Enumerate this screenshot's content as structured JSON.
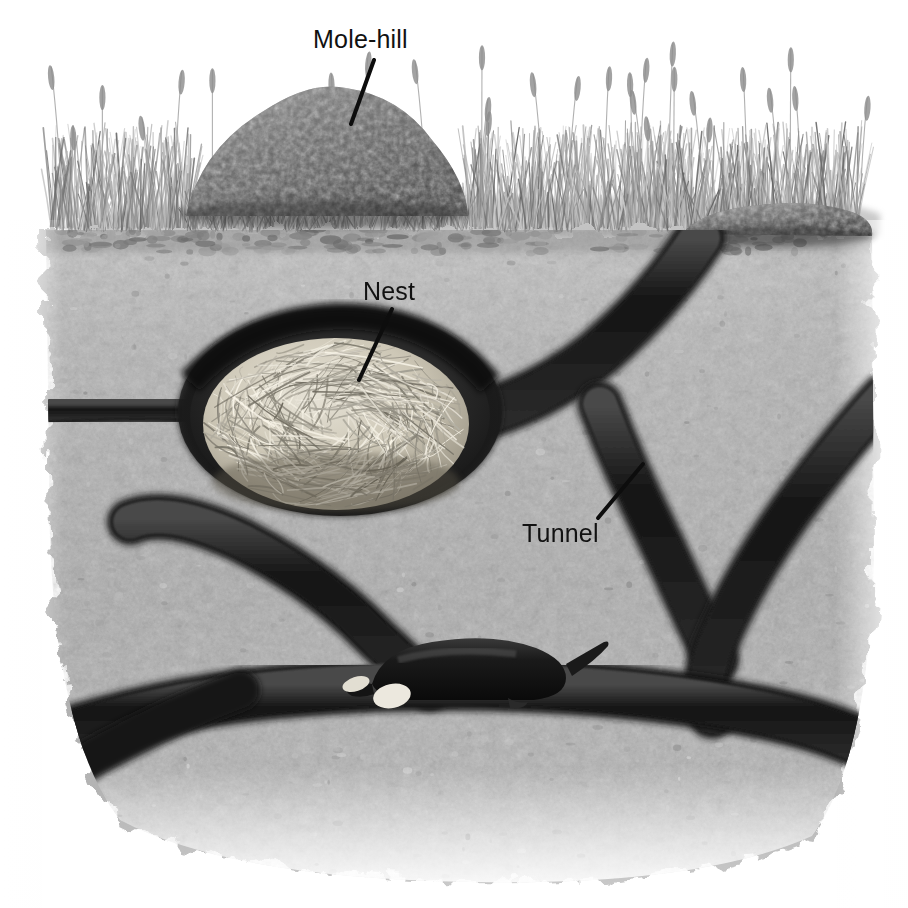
{
  "figure": {
    "kind": "natural-history-illustration",
    "medium": "monochrome stipple and wash drawing",
    "canvas": {
      "width": 908,
      "height": 908,
      "background": "#ffffff"
    }
  },
  "labels": [
    {
      "id": "mole-hill",
      "text": "Mole-hill",
      "x": 313,
      "y": 27,
      "leader": {
        "x1": 374,
        "y1": 60,
        "x2": 351,
        "y2": 124
      }
    },
    {
      "id": "nest",
      "text": "Nest",
      "x": 363,
      "y": 279,
      "leader": {
        "x1": 392,
        "y1": 309,
        "x2": 359,
        "y2": 380
      }
    },
    {
      "id": "tunnel",
      "text": "Tunnel",
      "x": 522,
      "y": 521,
      "leader": {
        "x1": 598,
        "y1": 518,
        "x2": 643,
        "y2": 464
      }
    }
  ],
  "palette": {
    "paper": "#ffffff",
    "soil_light": "#bdbdbd",
    "soil_mid": "#ababab",
    "soil_dark": "#8e8e8e",
    "soil_speckle": "#7d7d7d",
    "tunnel_dark": "#1c1c1c",
    "tunnel_edge": "#3d3d3d",
    "molehill_dark": "#4a4a4a",
    "molehill_light": "#8c8c8c",
    "grass_grey": "#9a9a9a",
    "grass_dark": "#6e6e6e",
    "nest_straw": "#d9d4c6",
    "nest_straw_dark": "#9b9483",
    "mole_body": "#161616",
    "mole_claw": "#ece8de",
    "label_ink": "#111111"
  },
  "scene": {
    "ground_line_y": 228,
    "soil_block": {
      "top": 228,
      "bottom": 880,
      "left": 46,
      "right": 872,
      "note": "ragged stippled edges fading to white at left, right and bottom"
    },
    "grass_band": {
      "top": 96,
      "bottom": 232,
      "note": "tufted turf with seed-headed stalks along whole width"
    },
    "molehill_main": {
      "cx": 320,
      "base_y": 212,
      "half_width": 135,
      "height": 128,
      "texture": "crumbly excavated soil clods"
    },
    "molehill_secondary": {
      "cx": 770,
      "base_y": 232,
      "half_width": 100,
      "height": 36,
      "texture": "flatter spoil heap over a rising tunnel"
    },
    "nest_chamber": {
      "cx": 340,
      "cy": 410,
      "rx": 155,
      "ry": 100,
      "contents": "ball of dry grass / straw lining"
    },
    "mole": {
      "cx": 470,
      "cy": 678,
      "length": 185,
      "facing": "left"
    },
    "tunnels": [
      {
        "id": "left-upper",
        "path": "horizontal run from the left edge into the nest chamber",
        "y": 418
      },
      {
        "id": "nest-right",
        "path": "from nest chamber rising right to the secondary mole-hill"
      },
      {
        "id": "right-vertical",
        "path": "steep shaft from mid-right junction down to the lower gallery"
      },
      {
        "id": "right-diagonal",
        "path": "long diagonal from upper right edge down to the lower gallery"
      },
      {
        "id": "blind-branch",
        "path": "blind-ended branch rising from lower gallery towards upper left",
        "tip": [
          132,
          520
        ]
      },
      {
        "id": "lower-main",
        "path": "main horizontal gallery across the bottom, occupied by the mole",
        "y": 690
      },
      {
        "id": "lower-left",
        "path": "gallery continuing down-left off the bottom-left of the block"
      },
      {
        "id": "lower-right",
        "path": "gallery continuing down-right off the bottom-right of the block"
      }
    ]
  }
}
